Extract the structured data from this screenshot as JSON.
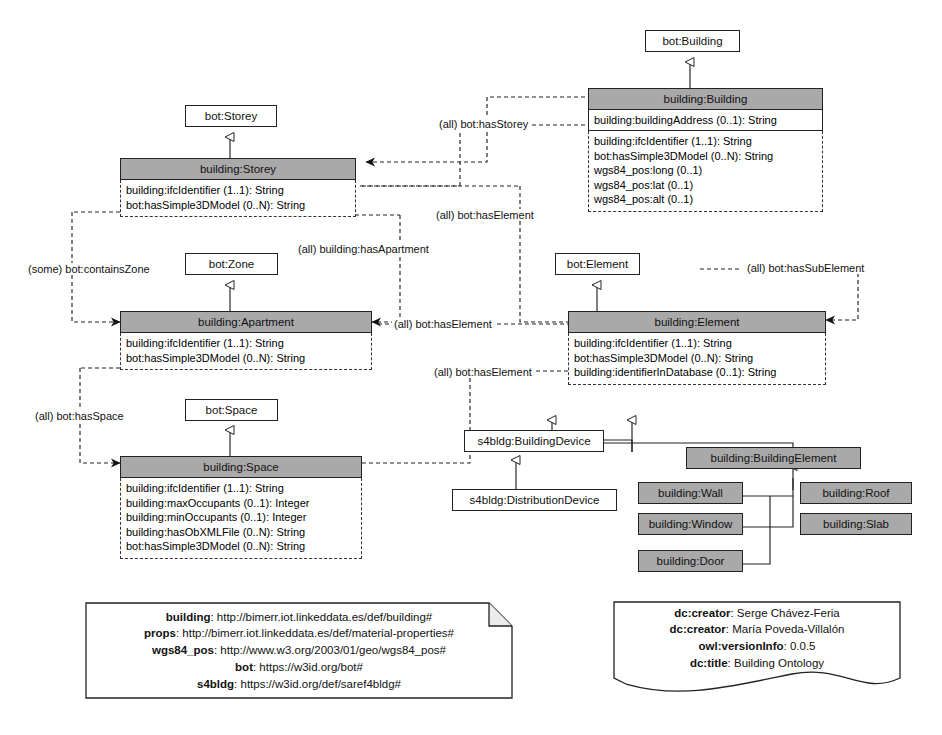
{
  "diagram": {
    "title": "Building Ontology",
    "accent_fill": "#a9a9a9",
    "line_color": "#222222"
  },
  "classes": {
    "bot_storey": {
      "name": "bot:Storey"
    },
    "bot_zone": {
      "name": "bot:Zone"
    },
    "bot_space": {
      "name": "bot:Space"
    },
    "bot_element": {
      "name": "bot:Element"
    },
    "bot_building": {
      "name": "bot:Building"
    },
    "building_storey": {
      "name": "building:Storey",
      "attrs": [
        "building:ifcIdentifier (1..1): String",
        "bot:hasSimple3DModel (0..N): String"
      ]
    },
    "building_apartment": {
      "name": "building:Apartment",
      "attrs": [
        "building:ifcIdentifier (1..1): String",
        "bot:hasSimple3DModel (0..N): String"
      ]
    },
    "building_space": {
      "name": "building:Space",
      "attrs": [
        "building:ifcIdentifier (1..1): String",
        "building:maxOccupants (0..1): Integer",
        "building:minOccupants (0..1): Integer",
        "building:hasObXMLFile (0..N): String",
        "bot:hasSimple3DModel (0..N): String"
      ]
    },
    "building_building": {
      "name": "building:Building",
      "mid": "building:buildingAddress (0..1): String",
      "attrs": [
        "building:ifcIdentifier (1..1): String",
        "bot:hasSimple3DModel (0..N): String",
        "wgs84_pos:long (0..1)",
        "wgs84_pos:lat (0..1)",
        "wgs84_pos:alt (0..1)"
      ]
    },
    "building_element": {
      "name": "building:Element",
      "attrs": [
        "building:ifcIdentifier (1..1): String",
        "bot:hasSimple3DModel (0..N): String",
        "building:identifierInDatabase (0..1): String"
      ]
    },
    "s4bldg_buildingdevice": {
      "name": "s4bldg:BuildingDevice"
    },
    "s4bldg_distributiondevice": {
      "name": "s4bldg:DistributionDevice"
    },
    "building_buildingelement": {
      "name": "building:BuildingElement"
    },
    "building_wall": {
      "name": "building:Wall"
    },
    "building_roof": {
      "name": "building:Roof"
    },
    "building_window": {
      "name": "building:Window"
    },
    "building_slab": {
      "name": "building:Slab"
    },
    "building_door": {
      "name": "building:Door"
    }
  },
  "edge_labels": {
    "has_storey": "(all) bot:hasStorey",
    "has_element_1": "(all) bot:hasElement",
    "has_apartment": "(all) building:hasApartment",
    "has_element_2": "(all) bot:hasElement",
    "has_element_3": "(all) bot:hasElement",
    "has_sub_element": "(all) bot:hasSubElement",
    "contains_zone": "(some) bot:containsZone",
    "has_space": "(all) bot:hasSpace"
  },
  "prefix_note": {
    "lines": [
      {
        "prefix": "building",
        "uri": "http://bimerr.iot.linkeddata.es/def/building#"
      },
      {
        "prefix": "props",
        "uri": "http://bimerr.iot.linkeddata.es/def/material-properties#"
      },
      {
        "prefix": "wgs84_pos",
        "uri": "http://www.w3.org/2003/01/geo/wgs84_pos#"
      },
      {
        "prefix": "bot",
        "uri": "https://w3id.org/bot#"
      },
      {
        "prefix": "s4bldg",
        "uri": "https://w3id.org/def/saref4bldg#"
      }
    ]
  },
  "metadata_note": {
    "lines": [
      {
        "key": "dc:creator",
        "value": "Serge Chávez-Feria"
      },
      {
        "key": "dc:creator",
        "value": "María Poveda-Villalón"
      },
      {
        "key": "owl:versionInfo",
        "value": "0.0.5"
      },
      {
        "key": "dc:title",
        "value": "Building Ontology"
      }
    ]
  }
}
